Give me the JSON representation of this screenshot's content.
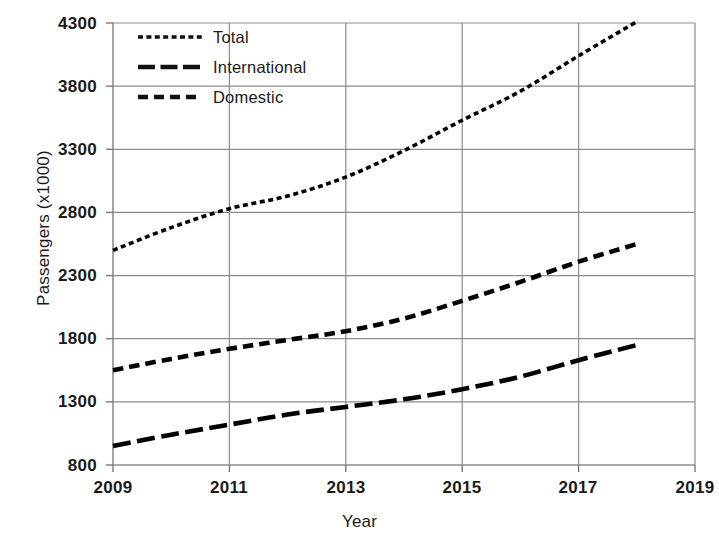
{
  "chart_data": {
    "type": "line",
    "title": "",
    "xlabel": "Year",
    "ylabel": "Passengers (x1000)",
    "xlim": [
      2009,
      2019
    ],
    "ylim": [
      800,
      4300
    ],
    "yticks": [
      800,
      1300,
      1800,
      2300,
      2800,
      3300,
      3800,
      4300
    ],
    "xticks": [
      2009,
      2011,
      2013,
      2015,
      2017,
      2019
    ],
    "grid": true,
    "legend_position": "top-left",
    "x": [
      2009,
      2010,
      2011,
      2012,
      2013,
      2014,
      2015,
      2016,
      2017,
      2018
    ],
    "series": [
      {
        "name": "Total",
        "dash": "dotted",
        "color": "#000000",
        "values": [
          2500,
          2680,
          2830,
          2930,
          3080,
          3290,
          3530,
          3760,
          4040,
          4310
        ]
      },
      {
        "name": "International",
        "dash": "long-dash",
        "color": "#000000",
        "values": [
          950,
          1040,
          1120,
          1200,
          1260,
          1320,
          1400,
          1500,
          1630,
          1750
        ]
      },
      {
        "name": "Domestic",
        "dash": "short-dash",
        "color": "#000000",
        "values": [
          1550,
          1640,
          1720,
          1790,
          1860,
          1960,
          2100,
          2250,
          2410,
          2550
        ]
      }
    ]
  },
  "axis": {
    "y_tick_labels": [
      "4300",
      "3800",
      "3300",
      "2800",
      "2300",
      "1800",
      "1300",
      "800"
    ],
    "x_tick_labels": [
      "2009",
      "2011",
      "2013",
      "2015",
      "2017",
      "2019"
    ],
    "y_title": "Passengers (x1000)",
    "x_title": "Year"
  },
  "legend": {
    "items": [
      {
        "label": "Total",
        "style": "dotted"
      },
      {
        "label": "International",
        "style": "long-dash"
      },
      {
        "label": "Domestic",
        "style": "short-dash"
      }
    ]
  },
  "colors": {
    "line": "#111111",
    "grid": "#8c8c8c",
    "axis": "#6f6f6f",
    "background": "#ffffff"
  }
}
